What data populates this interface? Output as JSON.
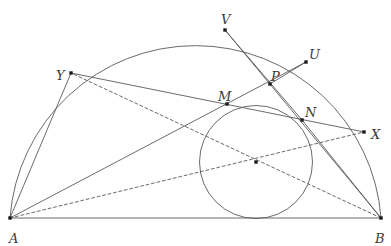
{
  "figure": {
    "width": 391,
    "height": 242,
    "background": "#ffffff",
    "stroke_color": "#5a5a5a",
    "point_color": "#1a1a1a",
    "label_color": "#3a3a3a"
  },
  "labels": {
    "A": "A",
    "B": "B",
    "V": "V",
    "U": "U",
    "Y": "Y",
    "P": "P",
    "M": "M",
    "N": "N",
    "X": "X"
  },
  "chart_data": {
    "type": "scatter",
    "xlabel": "",
    "ylabel": "",
    "xlim": [
      0,
      391
    ],
    "ylim": [
      242,
      0
    ],
    "grid": false,
    "legend": "none",
    "points": [
      {
        "name": "A",
        "x": 10,
        "y": 218,
        "label": "A",
        "label_x": 9,
        "label_y": 232
      },
      {
        "name": "B",
        "x": 381,
        "y": 218,
        "label": "B",
        "label_x": 375,
        "label_y": 232
      },
      {
        "name": "V",
        "x": 225,
        "y": 30,
        "label": "V",
        "label_x": 221,
        "label_y": 13
      },
      {
        "name": "U",
        "x": 306,
        "y": 62,
        "label": "U",
        "label_x": 309,
        "label_y": 48
      },
      {
        "name": "Y",
        "x": 71,
        "y": 73,
        "label": "Y",
        "label_x": 56,
        "label_y": 69
      },
      {
        "name": "P",
        "x": 270,
        "y": 84,
        "label": "P",
        "label_x": 271,
        "label_y": 70
      },
      {
        "name": "M",
        "x": 227,
        "y": 104,
        "label": "M",
        "label_x": 218,
        "label_y": 90
      },
      {
        "name": "N",
        "x": 302,
        "y": 120,
        "label": "N",
        "label_x": 305,
        "label_y": 106
      },
      {
        "name": "X",
        "x": 364,
        "y": 132,
        "label": "X",
        "label_x": 371,
        "label_y": 128
      },
      {
        "name": "I",
        "x": 256,
        "y": 162,
        "label": "",
        "label_x": 0,
        "label_y": 0
      }
    ],
    "arcs": [
      {
        "name": "semicircle-AB",
        "cx": 196,
        "cy": 218,
        "r": 186,
        "from": "A",
        "to": "B",
        "style": "solid"
      }
    ],
    "circles": [
      {
        "name": "inscribed-circle",
        "cx": 256,
        "cy": 162,
        "r": 56.5,
        "style": "solid"
      }
    ],
    "segments": [
      {
        "name": "AB",
        "from": "A",
        "to": "B",
        "style": "solid"
      },
      {
        "name": "AY",
        "from": "A",
        "to": "Y",
        "style": "solid"
      },
      {
        "name": "AU",
        "from": "A",
        "to": "U",
        "style": "solid"
      },
      {
        "name": "AX",
        "from": "A",
        "to": "X",
        "style": "dashed"
      },
      {
        "name": "BV",
        "from": "B",
        "to": "V",
        "style": "solid"
      },
      {
        "name": "BN",
        "from": "B",
        "to": "N",
        "style": "solid"
      },
      {
        "name": "BY",
        "from": "B",
        "to": "Y",
        "style": "dashed"
      },
      {
        "name": "YX",
        "from": "Y",
        "to": "X",
        "style": "solid"
      },
      {
        "name": "VN",
        "from": "V",
        "to": "N",
        "style": "solid"
      },
      {
        "name": "UP",
        "from": "U",
        "to": "P",
        "style": "solid"
      }
    ]
  }
}
